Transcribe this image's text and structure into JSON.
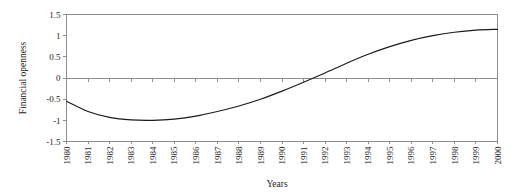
{
  "chart_data": {
    "type": "line",
    "title": "",
    "xlabel": "Years",
    "ylabel": "Financial openness",
    "xlim": [
      1980,
      2000
    ],
    "ylim": [
      -1.5,
      1.5
    ],
    "grid": false,
    "legend": "none",
    "zero_line": true,
    "line_color": "#1a1a1a",
    "axis_color": "#8c8c8c",
    "background_color": "#ffffff",
    "x_tick_labels": [
      "1980",
      "1981",
      "1982",
      "1983",
      "1984",
      "1985",
      "1986",
      "1987",
      "1988",
      "1989",
      "1990",
      "1991",
      "1992",
      "1993",
      "1994",
      "1995",
      "1996",
      "1997",
      "1998",
      "1999",
      "2000"
    ],
    "y_tick_labels": [
      "1.5",
      "1",
      "0.5",
      "0",
      "-0.5",
      "-1",
      "-1.5"
    ],
    "y_ticks": [
      1.5,
      1,
      0.5,
      0,
      -0.5,
      -1,
      -1.5
    ],
    "x": [
      1980,
      1981,
      1982,
      1983,
      1984,
      1985,
      1986,
      1987,
      1988,
      1989,
      1990,
      1991,
      1992,
      1993,
      1994,
      1995,
      1996,
      1997,
      1998,
      1999,
      2000
    ],
    "values": [
      -0.55,
      -0.79,
      -0.93,
      -0.99,
      -1.0,
      -0.97,
      -0.9,
      -0.79,
      -0.66,
      -0.5,
      -0.31,
      -0.1,
      0.12,
      0.35,
      0.56,
      0.74,
      0.89,
      1.0,
      1.08,
      1.13,
      1.15
    ],
    "annotations": {
      "zero_crossing_year": 1991,
      "minimum_value": -1.0,
      "minimum_year": 1984,
      "final_value": 1.15
    }
  }
}
